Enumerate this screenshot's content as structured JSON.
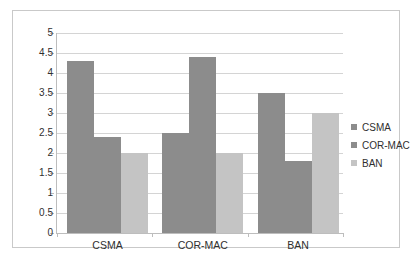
{
  "chart_data": {
    "type": "bar",
    "title": "",
    "xlabel": "",
    "ylabel": "",
    "categories": [
      "CSMA",
      "COR-MAC",
      "BAN"
    ],
    "series": [
      {
        "name": "CSMA",
        "color": "#8c8c8c",
        "values": [
          4.3,
          2.5,
          3.5
        ]
      },
      {
        "name": "COR-MAC",
        "color": "#8c8c8c",
        "values": [
          2.4,
          4.4,
          1.8
        ]
      },
      {
        "name": "BAN",
        "color": "#c4c4c4",
        "values": [
          2.0,
          2.0,
          3.0
        ]
      }
    ],
    "ylim": [
      0,
      5
    ],
    "ytick_labels": [
      "0",
      "0.5",
      "1",
      "1.5",
      "2",
      "2.5",
      "3",
      "3.5",
      "4",
      "4.5",
      "5"
    ],
    "ytick_values": [
      0,
      0.5,
      1,
      1.5,
      2,
      2.5,
      3,
      3.5,
      4,
      4.5,
      5
    ],
    "grid": true,
    "legend_position": "right",
    "legend": [
      "CSMA",
      "COR-MAC",
      "BAN"
    ]
  }
}
